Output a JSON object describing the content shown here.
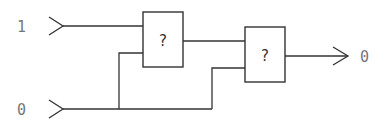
{
  "diagram": {
    "type": "logic-circuit",
    "inputs": [
      {
        "id": "in1",
        "label": "1"
      },
      {
        "id": "in2",
        "label": "0"
      }
    ],
    "gates": [
      {
        "id": "gate1",
        "label": "?"
      },
      {
        "id": "gate2",
        "label": "?"
      }
    ],
    "output": {
      "id": "out",
      "label": "0"
    },
    "connections": [
      {
        "from": "in1",
        "to": "gate1"
      },
      {
        "from": "in2",
        "to": "gate1"
      },
      {
        "from": "gate1",
        "to": "gate2"
      },
      {
        "from": "in2",
        "to": "gate2"
      },
      {
        "from": "gate2",
        "to": "out"
      }
    ]
  }
}
